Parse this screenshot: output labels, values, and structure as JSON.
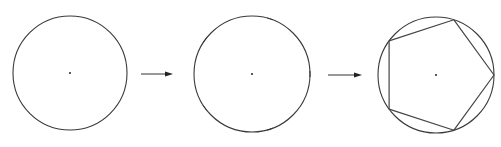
{
  "diagram": {
    "steps": [
      {
        "id": "step-1",
        "description": "Circle with center point",
        "divisions": 0,
        "polygon_sides": 0
      },
      {
        "id": "step-2",
        "description": "Circle divided into 5 equal parts (tick marks)",
        "divisions": 5,
        "polygon_sides": 0
      },
      {
        "id": "step-3",
        "description": "Division points connected to form inscribed regular pentagon",
        "divisions": 5,
        "polygon_sides": 5
      }
    ],
    "division_start_angle_deg": 0,
    "arrows": [
      {
        "from": "step-1",
        "to": "step-2"
      },
      {
        "from": "step-2",
        "to": "step-3"
      }
    ],
    "colors": {
      "stroke": "#3a3a3a",
      "background": "#ffffff"
    }
  }
}
